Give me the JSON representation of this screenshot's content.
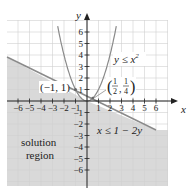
{
  "chart_data": {
    "type": "line",
    "title": "",
    "xlabel": "x",
    "ylabel": "y",
    "xlim": [
      -6.9,
      7
    ],
    "ylim": [
      -7.3,
      7.5
    ],
    "grid": true,
    "x_ticks": [
      "-6",
      "-5",
      "-4",
      "-3",
      "-2",
      "-1",
      "1",
      "2",
      "3",
      "4",
      "5",
      "6"
    ],
    "y_ticks": [
      "6",
      "5",
      "4",
      "3",
      "2",
      "1",
      "-1",
      "-2",
      "-3",
      "-4",
      "-5",
      "-6"
    ],
    "series": [
      {
        "name": "y = x^2",
        "kind": "parabola",
        "label": "y ≤ x²"
      },
      {
        "name": "x = 1 - 2y",
        "kind": "line",
        "label": "x ≤ 1 − 2y",
        "points": [
          [
            -6.9,
            3.95
          ],
          [
            6,
            -2.5
          ]
        ]
      }
    ],
    "annotations": [
      {
        "text": "(−1, 1)",
        "x": -1,
        "y": 1
      },
      {
        "text": "(1/2, 1/4)",
        "x": 0.5,
        "y": 0.25
      },
      {
        "text": "solution region",
        "x": -4.2,
        "y": -3.8
      }
    ],
    "shaded_region": "below line x = 1 - 2y and below parabola y = x^2",
    "colors": {
      "shade": "#d9d9d9",
      "curve": "#8a8a8a",
      "axis": "#222222",
      "grid": "#cfcfcf"
    }
  },
  "labels": {
    "y_axis": "y",
    "x_axis": "x",
    "parabola": "y ≤ x",
    "parabola_exp": "2",
    "line": "x ≤ 1 − 2y",
    "point1": "(−1, 1)",
    "point2_num1": "1",
    "point2_den1": "2",
    "point2_num2": "1",
    "point2_den2": "4",
    "region_line1": "solution",
    "region_line2": "region"
  }
}
